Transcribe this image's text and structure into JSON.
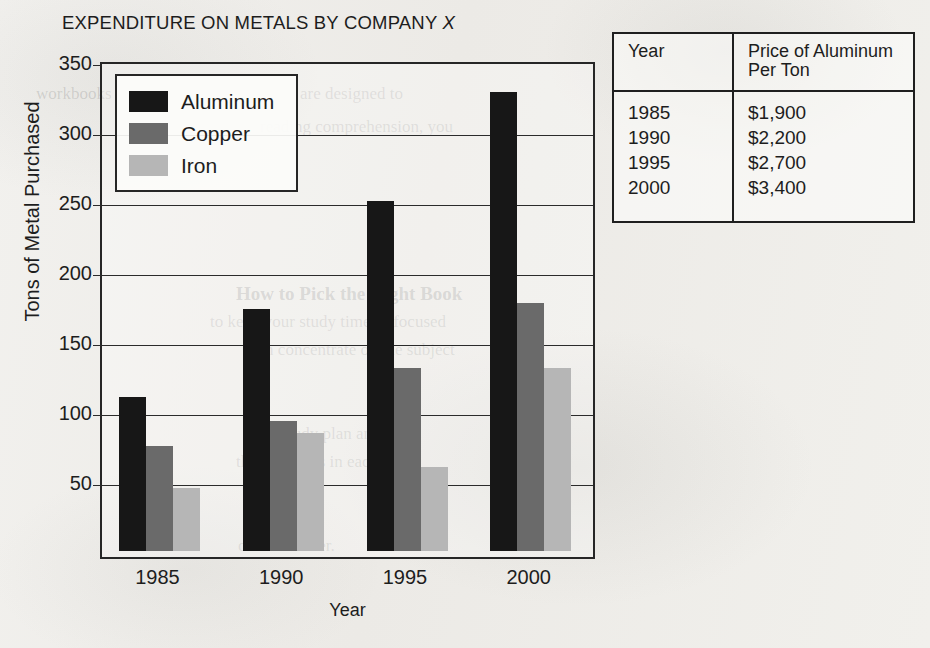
{
  "chart_data": {
    "type": "bar",
    "title": "EXPENDITURE ON METALS BY COMPANY X",
    "title_plain": "EXPENDITURE ON METALS BY COMPANY ",
    "title_italic": "X",
    "xlabel": "Year",
    "ylabel": "Tons of Metal Purchased",
    "categories": [
      "1985",
      "1990",
      "1995",
      "2000"
    ],
    "series": [
      {
        "name": "Aluminum",
        "color": "#171717",
        "values": [
          110,
          173,
          250,
          328
        ]
      },
      {
        "name": "Copper",
        "color": "#6a6a6a",
        "values": [
          75,
          93,
          131,
          177
        ]
      },
      {
        "name": "Iron",
        "color": "#b6b6b6",
        "values": [
          45,
          84,
          60,
          131
        ]
      }
    ],
    "ylim": [
      0,
      350
    ],
    "yticks": [
      50,
      100,
      150,
      200,
      250,
      300,
      350
    ],
    "ytick_labels": [
      "50",
      "100",
      "150",
      "200",
      "250",
      "300",
      "350"
    ],
    "grid": true,
    "legend_position": "top-left",
    "legend_entries": [
      "Aluminum",
      "Copper",
      "Iron"
    ]
  },
  "table": {
    "headers": {
      "year": "Year",
      "price_line1": "Price of Aluminum",
      "price_line2": "Per Ton"
    },
    "rows": [
      {
        "year": "1985",
        "price": "$1,900"
      },
      {
        "year": "1990",
        "price": "$2,200"
      },
      {
        "year": "1995",
        "price": "$2,700"
      },
      {
        "year": "2000",
        "price": "$3,400"
      }
    ]
  },
  "ghost_text": {
    "g1": "workbooks",
    "g2": "are designed to",
    "g3": "How to Pick the Right Book",
    "g4": "to keep your study time as focused",
    "g5": "reading comprehension, you",
    "g6": "can concentrate on the subject",
    "g7": "your study plan and",
    "g8": "the questions in each",
    "g9": "over and over."
  }
}
